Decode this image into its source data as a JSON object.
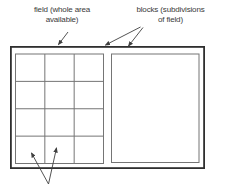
{
  "figure": {
    "labels": {
      "field": "field (whole area\navailable)",
      "blocks": "blocks (subdivisions\nof field)"
    },
    "field": {
      "grid_block": {
        "columns": 3,
        "rows": 4
      },
      "plain_block": {
        "subdivisions": 0
      }
    },
    "colors": {
      "background": "#ffffff",
      "outer_border": "#2f2f2f",
      "block_line": "#757575",
      "arrow": "#3f3f3f",
      "text": "#3a3a3a"
    }
  }
}
